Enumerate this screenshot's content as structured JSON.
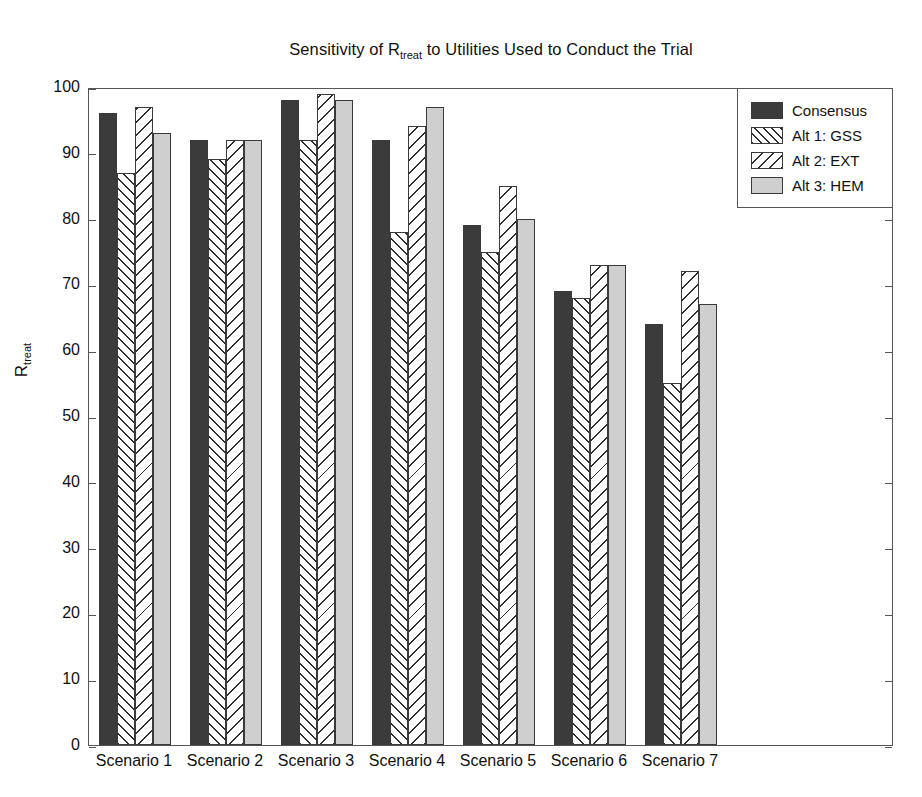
{
  "chart_data": {
    "type": "bar",
    "title_main_before": "Sensitivity of R",
    "title_sub": "treat",
    "title_main_after": " to Utilities Used to Conduct the Trial",
    "xlabel": "",
    "ylabel": "R_treat",
    "ylabel_main": "R",
    "ylabel_sub": "treat",
    "ylim": [
      0,
      100
    ],
    "ytick_step": 10,
    "yticks": [
      0,
      10,
      20,
      30,
      40,
      50,
      60,
      70,
      80,
      90,
      100
    ],
    "grid": false,
    "legend_position": "top-right (inside axes)",
    "categories": [
      "Scenario 1",
      "Scenario 2",
      "Scenario 3",
      "Scenario 4",
      "Scenario 5",
      "Scenario 6",
      "Scenario 7"
    ],
    "series": [
      {
        "name": "Consensus",
        "fill": "solid-dark",
        "color": "#3b3b3b",
        "values": [
          96,
          92,
          98,
          92,
          79,
          69,
          64
        ]
      },
      {
        "name": "Alt 1: GSS",
        "fill": "hatch-forward",
        "color": "#ffffff",
        "values": [
          87,
          89,
          92,
          78,
          75,
          68,
          55
        ]
      },
      {
        "name": "Alt 2: EXT",
        "fill": "hatch-backward",
        "color": "#ffffff",
        "values": [
          97,
          92,
          99,
          94,
          85,
          73,
          72
        ]
      },
      {
        "name": "Alt 3: HEM",
        "fill": "solid-light",
        "color": "#cfcfcf",
        "values": [
          93,
          92,
          98,
          97,
          80,
          73,
          67
        ]
      }
    ]
  },
  "colors": {
    "axis": "#555555",
    "text": "#111111",
    "background": "#ffffff",
    "series_consensus": "#3b3b3b",
    "series_hem": "#cfcfcf",
    "hatch": "#2e2e2e"
  }
}
